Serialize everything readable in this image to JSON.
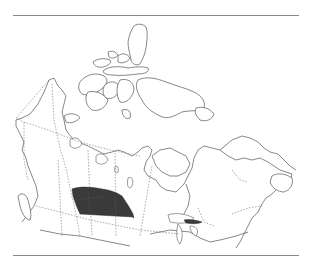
{
  "figure": {
    "type": "range-map",
    "region": "Canada",
    "colors": {
      "background": "#ffffff",
      "outline": "#555555",
      "rule": "#8a8a8a",
      "range_fill": "#3a3a3a"
    },
    "layers": [
      {
        "name": "coastline",
        "style": "solid"
      },
      {
        "name": "provincial-borders",
        "style": "dashed"
      },
      {
        "name": "range",
        "style": "filled",
        "areas": [
          "southern-prairies",
          "lake-erie-shore"
        ]
      }
    ]
  }
}
